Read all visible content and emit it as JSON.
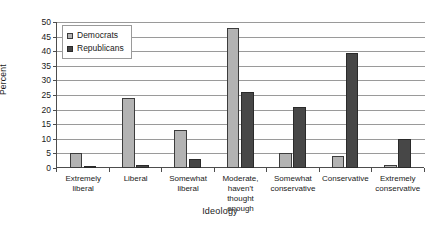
{
  "chart_data": {
    "type": "bar",
    "title": "",
    "xlabel": "Ideology",
    "ylabel": "Percent",
    "ylim": [
      0,
      50
    ],
    "ytick_step": 5,
    "yticks": [
      50,
      45,
      40,
      35,
      30,
      25,
      20,
      15,
      10,
      5,
      0
    ],
    "grid": true,
    "legend_position": "top-left inside plot",
    "categories": [
      "Extremely liberal",
      "Liberal",
      "Somewhat liberal",
      "Moderate, haven't thought enough",
      "Somewhat conservative",
      "Conservative",
      "Extremely conservative"
    ],
    "category_label_lines": [
      [
        "Extremely",
        "liberal"
      ],
      [
        "Liberal"
      ],
      [
        "Somewhat",
        "liberal"
      ],
      [
        "Moderate,",
        "haven't",
        "thought enough"
      ],
      [
        "Somewhat",
        "conservative"
      ],
      [
        "Conservative"
      ],
      [
        "Extremely",
        "conservative"
      ]
    ],
    "series": [
      {
        "name": "Democrats",
        "color": "#b3b3b3",
        "values": [
          5,
          24,
          13,
          48,
          5,
          4,
          1
        ]
      },
      {
        "name": "Republicans",
        "color": "#474747",
        "values": [
          0.4,
          1,
          3,
          26,
          21,
          39.5,
          10
        ]
      }
    ]
  },
  "legend": {
    "items": [
      {
        "label": "Democrats"
      },
      {
        "label": "Republicans"
      }
    ]
  }
}
